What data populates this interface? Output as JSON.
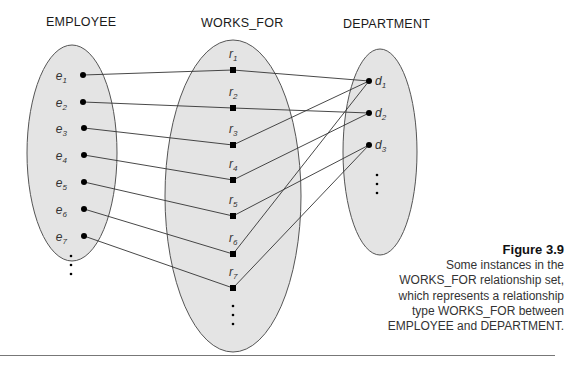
{
  "titles": {
    "employee": "EMPLOYEE",
    "works_for": "WORKS_FOR",
    "department": "DEPARTMENT"
  },
  "employees": [
    {
      "base": "e",
      "sub": "1"
    },
    {
      "base": "e",
      "sub": "2"
    },
    {
      "base": "e",
      "sub": "3"
    },
    {
      "base": "e",
      "sub": "4"
    },
    {
      "base": "e",
      "sub": "5"
    },
    {
      "base": "e",
      "sub": "6"
    },
    {
      "base": "e",
      "sub": "7"
    }
  ],
  "relationships": [
    {
      "base": "r",
      "sub": "1",
      "employee": "e1",
      "department": "d1"
    },
    {
      "base": "r",
      "sub": "2",
      "employee": "e2",
      "department": "d2"
    },
    {
      "base": "r",
      "sub": "3",
      "employee": "e3",
      "department": "d1"
    },
    {
      "base": "r",
      "sub": "4",
      "employee": "e4",
      "department": "d2"
    },
    {
      "base": "r",
      "sub": "5",
      "employee": "e5",
      "department": "d3"
    },
    {
      "base": "r",
      "sub": "6",
      "employee": "e6",
      "department": "d1"
    },
    {
      "base": "r",
      "sub": "7",
      "employee": "e7",
      "department": "d3"
    }
  ],
  "departments": [
    {
      "base": "d",
      "sub": "1"
    },
    {
      "base": "d",
      "sub": "2"
    },
    {
      "base": "d",
      "sub": "3"
    }
  ],
  "caption": {
    "label": "Figure 3.9",
    "text": "Some instances in the WORKS_FOR relationship set, which represents a relationship type WORKS_FOR between EMPLOYEE and DEPARTMENT."
  },
  "colors": {
    "ellipse_fill": "#e4e4e4",
    "ellipse_stroke": "#555555",
    "line": "#333333",
    "node": "#000000"
  }
}
